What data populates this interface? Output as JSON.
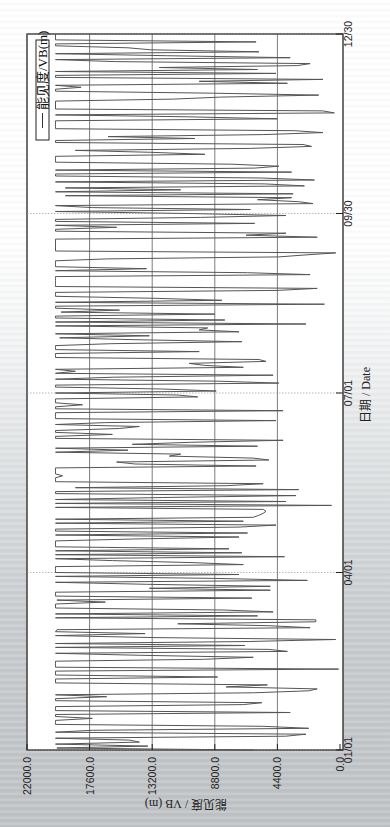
{
  "chart_data": {
    "type": "line",
    "orientation": "rotated-90-clockwise",
    "title": "",
    "xlabel": "日期 / Date",
    "ylabel": "能见度 / VB (m)",
    "legend": [
      {
        "label": "能见度/VB(m)",
        "color": "#555555"
      }
    ],
    "legend_position": "top-left (rotated: top-right of plot)",
    "x_tick_labels": [
      "01/01",
      "04/01",
      "07/01",
      "09/30",
      "12/30"
    ],
    "x_tick_day_index": [
      0,
      90,
      181,
      272,
      363
    ],
    "y_tick_labels": [
      "0.0",
      "4400.0",
      "8800.0",
      "13200.0",
      "17600.0",
      "22000.0"
    ],
    "y_ticks": [
      0,
      4400,
      8800,
      13200,
      17600,
      22000
    ],
    "ylim": [
      0,
      22000
    ],
    "xlim_days": [
      0,
      363
    ],
    "grid": true,
    "series": [
      {
        "name": "能见度/VB(m)",
        "color": "#555555",
        "note": "daily visibility values (m), approximated from the dense trace; max ≈ 20000, frequent drops to near 0",
        "values": []
      }
    ]
  },
  "labels": {
    "legend": "能见度/VB(m)",
    "x_title": "日期 / Date",
    "y_title": "能见度 / VB (m)"
  }
}
